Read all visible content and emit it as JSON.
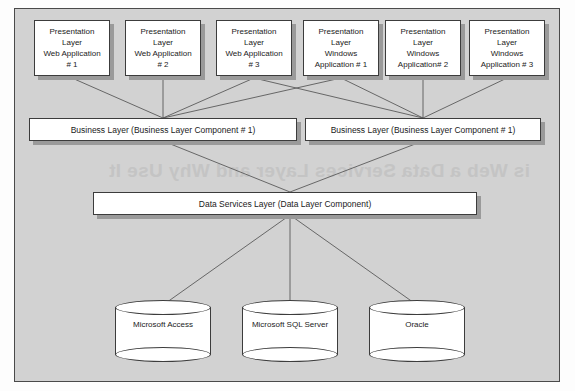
{
  "diagram": {
    "ghost_text": "is Web a Data Services Layer and Why Use It",
    "presentation_web": [
      {
        "label": "Presentation\nLayer\nWeb Application\n# 1"
      },
      {
        "label": "Presentation\nLayer\nWeb Application\n# 2"
      },
      {
        "label": "Presentation\nLayer\nWeb Application\n# 3"
      }
    ],
    "presentation_windows": [
      {
        "label": "Presentation\nLayer\nWindows\nApplication # 1"
      },
      {
        "label": "Presentation\nLayer\nWindows\nApplication# 2"
      },
      {
        "label": "Presentation\nLayer\nWindows\nApplication # 3"
      }
    ],
    "business_layers": [
      {
        "label": "Business Layer (Business Layer Component # 1)"
      },
      {
        "label": "Business Layer (Business Layer Component # 1)"
      }
    ],
    "data_layer": {
      "label": "Data Services Layer (Data Layer Component)"
    },
    "databases": [
      {
        "label": "Microsoft Access"
      },
      {
        "label": "Microsoft SQL Server"
      },
      {
        "label": "Oracle"
      }
    ],
    "colors": {
      "plate_background": "#d2d2d2",
      "node_fill": "#ffffff",
      "node_border": "#3c3c3c",
      "node_shadow": "#9a9a9a",
      "connector": "#5a5a5a"
    }
  }
}
